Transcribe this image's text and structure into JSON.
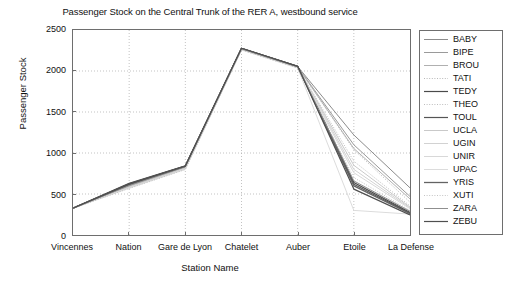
{
  "chart_data": {
    "type": "line",
    "title": "Passenger Stock on the Central Trunk of the RER A, westbound service",
    "xlabel": "Station Name",
    "ylabel": "Passenger Stock",
    "categories": [
      "Vincennes",
      "Nation",
      "Gare de Lyon",
      "Chatelet",
      "Auber",
      "Etoile",
      "La Defense"
    ],
    "ylim": [
      0,
      2500
    ],
    "yticks": [
      0,
      500,
      1000,
      1500,
      2000,
      2500
    ],
    "grid": true,
    "grid_style": "dotted",
    "legend_position": "right-outside",
    "series": [
      {
        "name": "BABY",
        "values": [
          326,
          608,
          836,
          2275,
          2055,
          1220,
          575
        ],
        "color": "#8c8c8c",
        "style": "solid",
        "width": 1.0
      },
      {
        "name": "BIPE",
        "values": [
          326,
          600,
          830,
          2272,
          2052,
          1100,
          470
        ],
        "color": "#9a9a9a",
        "style": "solid",
        "width": 1.0
      },
      {
        "name": "BROU",
        "values": [
          326,
          596,
          826,
          2270,
          2050,
          1055,
          440
        ],
        "color": "#b0b0b0",
        "style": "solid",
        "width": 1.0
      },
      {
        "name": "TATI",
        "values": [
          326,
          592,
          822,
          2268,
          2048,
          1040,
          400
        ],
        "color": "#b8b8b8",
        "style": "dotted",
        "width": 1.0
      },
      {
        "name": "TEDY",
        "values": [
          326,
          630,
          845,
          2278,
          2058,
          640,
          275
        ],
        "color": "#4a4a4a",
        "style": "solid",
        "width": 1.2
      },
      {
        "name": "THEO",
        "values": [
          326,
          588,
          818,
          2266,
          2046,
          900,
          355
        ],
        "color": "#bdbdbd",
        "style": "dotted",
        "width": 1.0
      },
      {
        "name": "TOUL",
        "values": [
          326,
          625,
          842,
          2276,
          2056,
          620,
          265
        ],
        "color": "#555555",
        "style": "solid",
        "width": 1.2
      },
      {
        "name": "UCLA",
        "values": [
          326,
          584,
          814,
          2264,
          2044,
          850,
          340
        ],
        "color": "#c9c9c9",
        "style": "solid",
        "width": 1.0
      },
      {
        "name": "UGIN",
        "values": [
          326,
          580,
          810,
          2262,
          2042,
          800,
          330
        ],
        "color": "#d2d2d2",
        "style": "solid",
        "width": 1.0
      },
      {
        "name": "UNIR",
        "values": [
          326,
          576,
          806,
          2260,
          2040,
          760,
          320
        ],
        "color": "#d8d8d8",
        "style": "solid",
        "width": 1.0
      },
      {
        "name": "UPAC",
        "values": [
          326,
          572,
          802,
          2258,
          2038,
          300,
          255
        ],
        "color": "#dcdcdc",
        "style": "solid",
        "width": 1.0
      },
      {
        "name": "YRIS",
        "values": [
          326,
          615,
          838,
          2274,
          2054,
          600,
          260
        ],
        "color": "#636363",
        "style": "solid",
        "width": 1.3
      },
      {
        "name": "XUTI",
        "values": [
          326,
          568,
          798,
          2256,
          2036,
          700,
          300
        ],
        "color": "#c4c4c4",
        "style": "dotted",
        "width": 1.0
      },
      {
        "name": "ZARA",
        "values": [
          326,
          604,
          834,
          2273,
          2051,
          660,
          290
        ],
        "color": "#8f8f8f",
        "style": "solid",
        "width": 1.0
      },
      {
        "name": "ZEBU",
        "values": [
          326,
          620,
          840,
          2277,
          2057,
          560,
          245
        ],
        "color": "#4f4f4f",
        "style": "solid",
        "width": 1.2
      }
    ]
  }
}
